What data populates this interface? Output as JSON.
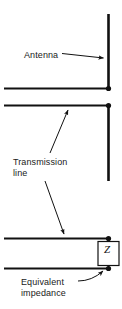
{
  "figure": {
    "background_color": "#ffffff",
    "line_color": "#111111"
  },
  "labels": {
    "antenna": "Antenna",
    "transmission_line": "Transmission\nline",
    "equivalent_impedance": "Equivalent\nimpedance",
    "impedance_symbol": "Z"
  },
  "components": {
    "antenna": {
      "name": "antenna-element",
      "type": "vertical-conductor",
      "x": 108,
      "y_top": 14,
      "y_bottom": 88
    },
    "transmission_line_upper": {
      "name": "upper-conductor",
      "type": "horizontal-conductor",
      "x_start": 4,
      "x_end": 108,
      "y": 88
    },
    "transmission_line_lower_top": {
      "name": "lower-section-upper-conductor",
      "type": "horizontal-conductor",
      "x_start": 4,
      "x_end": 108,
      "y": 105
    },
    "vertical_mid": {
      "name": "mid-vertical-conductor",
      "x": 108,
      "y_top": 105,
      "y_bottom": 181
    },
    "bottom_upper_conductor": {
      "name": "bottom-upper-conductor",
      "x_start": 4,
      "x_end": 108,
      "y": 238
    },
    "bottom_lower_conductor": {
      "name": "bottom-lower-conductor",
      "x_start": 4,
      "x_end": 108,
      "y": 268
    },
    "impedance_box": {
      "name": "impedance-box",
      "x": 97,
      "y": 240,
      "width": 20,
      "height": 26
    }
  },
  "junction_dots": [
    {
      "name": "antenna-feed-dot",
      "x": 108,
      "y": 88
    },
    {
      "name": "line-top-dot",
      "x": 108,
      "y": 105
    },
    {
      "name": "impedance-top-dot",
      "x": 108,
      "y": 239
    },
    {
      "name": "impedance-bottom-dot",
      "x": 108,
      "y": 268
    }
  ],
  "leader_arrows": [
    {
      "name": "antenna-leader",
      "from_x": 63,
      "from_y": 54,
      "to_x": 105,
      "to_y": 58
    },
    {
      "name": "transmission-line-leader-up",
      "from_x": 52,
      "from_y": 152,
      "to_x": 68,
      "to_y": 108
    },
    {
      "name": "transmission-line-leader-down",
      "from_x": 47,
      "from_y": 180,
      "to_x": 65,
      "to_y": 235
    },
    {
      "name": "equivalent-impedance-leader",
      "from_x": 80,
      "from_y": 280,
      "to_x": 105,
      "to_y": 270
    }
  ]
}
